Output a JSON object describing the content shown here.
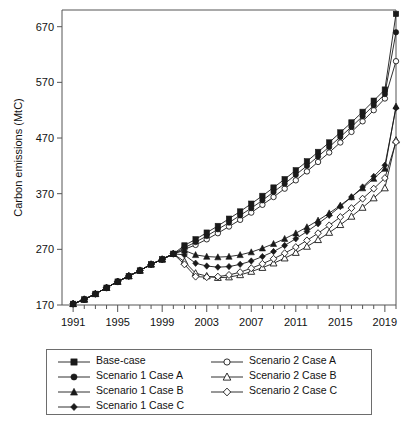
{
  "chart_data": {
    "type": "line",
    "title": "",
    "xlabel": "",
    "ylabel": "Carbon emissions (MtC)",
    "xlim": [
      1990,
      2020
    ],
    "ylim": [
      170,
      700
    ],
    "yticks": [
      170,
      270,
      370,
      470,
      570,
      670
    ],
    "xticks": [
      1991,
      1995,
      1999,
      2003,
      2007,
      2011,
      2015,
      2019
    ],
    "minor_xticks_every": 1,
    "grid": false,
    "legend_position": "below-plot",
    "x": [
      1991,
      1992,
      1993,
      1994,
      1995,
      1996,
      1997,
      1998,
      1999,
      2000,
      2001,
      2002,
      2003,
      2004,
      2005,
      2006,
      2007,
      2008,
      2009,
      2010,
      2011,
      2012,
      2013,
      2014,
      2015,
      2016,
      2017,
      2018,
      2019,
      2020
    ],
    "series": [
      {
        "name": "Base-case",
        "marker": "filled-square",
        "values": [
          172,
          180,
          190,
          201,
          212,
          222,
          232,
          243,
          252,
          262,
          277,
          288,
          300,
          312,
          325,
          338,
          352,
          366,
          381,
          396,
          412,
          428,
          445,
          462,
          480,
          498,
          517,
          537,
          557,
          693
        ]
      },
      {
        "name": "Scenario 1 Case A",
        "marker": "filled-circle",
        "values": [
          172,
          180,
          190,
          201,
          212,
          222,
          232,
          243,
          252,
          262,
          273,
          283,
          294,
          306,
          318,
          331,
          344,
          358,
          373,
          388,
          404,
          420,
          437,
          454,
          472,
          490,
          509,
          529,
          549,
          660
        ]
      },
      {
        "name": "Scenario 1 Case B",
        "marker": "filled-triangle",
        "values": [
          172,
          180,
          190,
          201,
          212,
          222,
          232,
          243,
          252,
          262,
          268,
          260,
          257,
          256,
          257,
          260,
          265,
          272,
          280,
          289,
          299,
          310,
          322,
          335,
          349,
          364,
          380,
          397,
          415,
          527
        ]
      },
      {
        "name": "Scenario 1 Case C",
        "marker": "filled-diamond",
        "values": [
          172,
          180,
          190,
          201,
          212,
          222,
          232,
          243,
          252,
          262,
          260,
          245,
          240,
          238,
          239,
          243,
          249,
          257,
          266,
          277,
          289,
          302,
          316,
          331,
          347,
          364,
          382,
          401,
          421,
          524
        ]
      },
      {
        "name": "Scenario 2 Case A",
        "marker": "open-circle",
        "values": [
          172,
          180,
          190,
          201,
          212,
          222,
          232,
          243,
          252,
          262,
          270,
          278,
          288,
          299,
          311,
          323,
          336,
          350,
          364,
          379,
          394,
          410,
          427,
          444,
          462,
          481,
          500,
          520,
          541,
          608
        ]
      },
      {
        "name": "Scenario 2 Case B",
        "marker": "open-triangle",
        "values": [
          172,
          180,
          190,
          201,
          212,
          222,
          232,
          243,
          252,
          262,
          248,
          227,
          222,
          219,
          220,
          224,
          230,
          237,
          245,
          254,
          264,
          275,
          287,
          300,
          314,
          329,
          345,
          362,
          380,
          466
        ]
      },
      {
        "name": "Scenario 2 Case C",
        "marker": "open-diamond",
        "values": [
          172,
          180,
          190,
          201,
          212,
          222,
          232,
          243,
          252,
          262,
          243,
          221,
          220,
          221,
          224,
          229,
          236,
          244,
          253,
          263,
          274,
          286,
          299,
          313,
          328,
          344,
          361,
          379,
          398,
          463
        ]
      }
    ]
  },
  "legend": {
    "entries": [
      {
        "label": "Base-case",
        "marker": "filled-square"
      },
      {
        "label": "Scenario 2 Case A",
        "marker": "open-circle"
      },
      {
        "label": "Scenario 1 Case A",
        "marker": "filled-circle"
      },
      {
        "label": "Scenario 2 Case B",
        "marker": "open-triangle"
      },
      {
        "label": "Scenario 1 Case B",
        "marker": "filled-triangle"
      },
      {
        "label": "Scenario 2 Case C",
        "marker": "open-diamond"
      },
      {
        "label": "Scenario 1 Case C",
        "marker": "filled-diamond"
      },
      {
        "label": "",
        "marker": "none"
      }
    ]
  },
  "colors": {
    "ink": "#1a1a1a",
    "axis": "#555555",
    "legend_border": "#6d6d6d",
    "background": "#ffffff"
  }
}
